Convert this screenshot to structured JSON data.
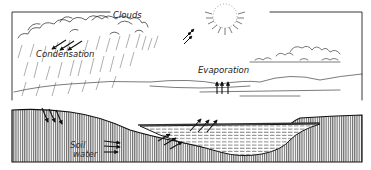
{
  "diagram": {
    "labels": {
      "clouds": "Clouds",
      "condensation": "Condensation",
      "evaporation": "Evaporation",
      "soil_line1": "Soil",
      "soil_line2": "water"
    },
    "colors": {
      "ink": "#222222",
      "background": "#ffffff",
      "hatch": "#555555"
    }
  }
}
